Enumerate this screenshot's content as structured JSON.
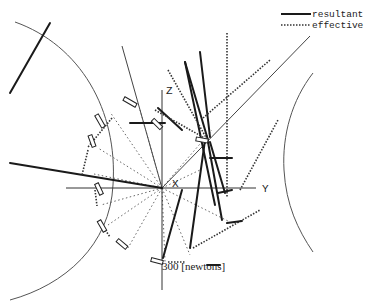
{
  "legend": {
    "items": [
      {
        "label": "resultant",
        "style": "solid"
      },
      {
        "label": "effective",
        "style": "dotted"
      }
    ]
  },
  "axes": {
    "z_label": "Z",
    "y_label": "Y",
    "x_label": "X"
  },
  "scale": {
    "label": "300 [newtons]"
  },
  "colors": {
    "background": "#ffffff",
    "ink": "#1a1a1a"
  }
}
